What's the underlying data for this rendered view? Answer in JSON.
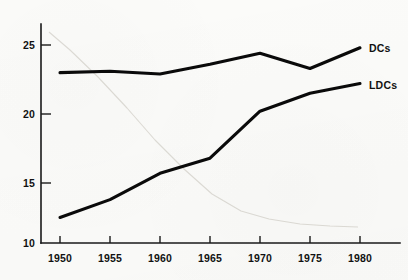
{
  "chart_data": {
    "type": "line",
    "title": "",
    "subtitle": "",
    "xlabel": "",
    "ylabel": "",
    "x": [
      1950,
      1955,
      1960,
      1965,
      1970,
      1975,
      1980
    ],
    "categories": [
      "1950",
      "1955",
      "1960",
      "1965",
      "1970",
      "1975",
      "1980"
    ],
    "xtick_labels": [
      "1950",
      "1955",
      "1960",
      "1965",
      "1970",
      "1975",
      "1980"
    ],
    "ytick_labels": [
      "10",
      "15",
      "20",
      "25"
    ],
    "yticks": [
      10,
      15,
      20,
      25
    ],
    "xlim": [
      1948,
      1983
    ],
    "ylim": [
      10,
      26
    ],
    "grid": false,
    "legend_position": "right-inline-end-of-line",
    "series": [
      {
        "name": "DCs",
        "label": "DCs",
        "color": "#0a0a0a",
        "values": [
          23.0,
          23.1,
          22.9,
          23.6,
          24.4,
          23.3,
          24.8
        ]
      },
      {
        "name": "LDCs",
        "label": "LDCs",
        "color": "#0a0a0a",
        "values": [
          12.5,
          13.8,
          15.7,
          16.8,
          20.2,
          21.5,
          22.2
        ]
      }
    ],
    "annotations": [
      {
        "text": "DCs",
        "x": 1980,
        "y": 24.8
      },
      {
        "text": "LDCs",
        "x": 1980,
        "y": 22.2
      }
    ],
    "background_artifact": {
      "description": "faint-descending-ghost-curve",
      "color": "#dedcd6",
      "x": [
        1949,
        1952,
        1956,
        1960,
        1964,
        1968,
        1972,
        1976,
        1980
      ],
      "y": [
        25.9,
        24.6,
        22.6,
        20.4,
        18.1,
        16.0,
        14.2,
        13.0,
        12.4
      ]
    }
  },
  "axis": {
    "y_label_25": "25",
    "y_label_20": "20",
    "y_label_15": "15",
    "y_label_10": "10",
    "x_label_1950": "1950",
    "x_label_1955": "1955",
    "x_label_1960": "1960",
    "x_label_1965": "1965",
    "x_label_1970": "1970",
    "x_label_1975": "1975",
    "x_label_1980": "1980"
  },
  "legend": {
    "dcs": "DCs",
    "ldcs": "LDCs"
  },
  "colors": {
    "line": "#0a0a0a",
    "axis": "#1a1a1a",
    "ghost": "#dedcd6",
    "background": "#fbfbf9",
    "text": "#111111"
  }
}
